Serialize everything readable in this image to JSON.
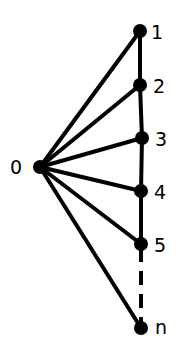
{
  "diagram": {
    "type": "fan-graph",
    "colors": {
      "edge": "#000000",
      "node": "#000000",
      "label": "#000000",
      "background": "#ffffff"
    },
    "hub": {
      "id": "0",
      "label": "0",
      "x": 40,
      "y": 167,
      "label_x": 10,
      "label_y": 174
    },
    "path_nodes": [
      {
        "id": "1",
        "label": "1",
        "x": 140,
        "y": 31,
        "label_x": 151,
        "label_y": 39
      },
      {
        "id": "2",
        "label": "2",
        "x": 140,
        "y": 85,
        "label_x": 153,
        "label_y": 93
      },
      {
        "id": "3",
        "label": "3",
        "x": 142,
        "y": 138,
        "label_x": 155,
        "label_y": 146
      },
      {
        "id": "4",
        "label": "4",
        "x": 141,
        "y": 191,
        "label_x": 154,
        "label_y": 199
      },
      {
        "id": "5",
        "label": "5",
        "x": 141,
        "y": 244,
        "label_x": 154,
        "label_y": 252
      },
      {
        "id": "n",
        "label": "n",
        "x": 141,
        "y": 328,
        "label_x": 155,
        "label_y": 334
      }
    ],
    "edges": [
      {
        "from": "0",
        "to": "1",
        "style": "solid"
      },
      {
        "from": "0",
        "to": "2",
        "style": "solid"
      },
      {
        "from": "0",
        "to": "3",
        "style": "solid"
      },
      {
        "from": "0",
        "to": "4",
        "style": "solid"
      },
      {
        "from": "0",
        "to": "5",
        "style": "solid"
      },
      {
        "from": "0",
        "to": "n",
        "style": "solid"
      },
      {
        "from": "1",
        "to": "2",
        "style": "solid"
      },
      {
        "from": "2",
        "to": "3",
        "style": "solid"
      },
      {
        "from": "3",
        "to": "4",
        "style": "solid"
      },
      {
        "from": "4",
        "to": "5",
        "style": "solid"
      },
      {
        "from": "5",
        "to": "n",
        "style": "dashed"
      }
    ],
    "node_radius": 7,
    "edge_width": 4
  }
}
